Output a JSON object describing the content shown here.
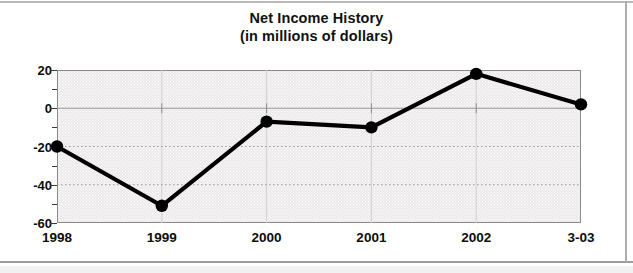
{
  "chart_data": {
    "type": "line",
    "title": "Net Income History",
    "subtitle": "(in millions of dollars)",
    "xlabel": "",
    "ylabel": "",
    "categories": [
      "1998",
      "1999",
      "2000",
      "2001",
      "2002",
      "3-03"
    ],
    "values": [
      -20,
      -51,
      -7,
      -10,
      18,
      2
    ],
    "ylim": [
      -60,
      20
    ],
    "yticks": [
      20,
      0,
      -20,
      -40,
      -60
    ],
    "ytick_labels": [
      "20",
      "0",
      "-20",
      "-40",
      "-60"
    ],
    "yminor_ticks": [
      10,
      -10,
      -30,
      -50
    ],
    "grid": true,
    "grid_style": "dotted",
    "legend": null,
    "series": [
      {
        "name": "Net Income",
        "values": [
          -20,
          -51,
          -7,
          -10,
          18,
          2
        ],
        "marker": "filled-circle",
        "line_color": "#000000",
        "marker_color": "#000000"
      }
    ],
    "colors": {
      "line": "#000000",
      "marker": "#000000",
      "plot_background": "#eceaea",
      "grid": "#9a9a9a",
      "axis": "#8a8a8a",
      "text": "#0d0d0d",
      "page_background": "#ffffff"
    }
  }
}
